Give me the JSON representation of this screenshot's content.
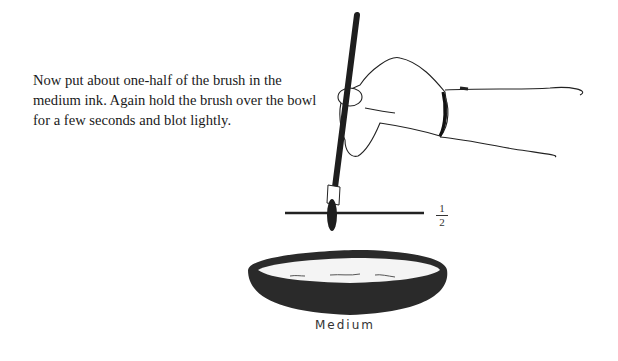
{
  "page": {
    "instruction_text": "Now put about one-half of the brush in the medium ink. Again hold the brush over the bowl for a few seconds and blot lightly.",
    "fraction": {
      "numerator": "1",
      "denominator": "2"
    },
    "bowl_label": "Medium"
  },
  "colors": {
    "ink": "#1e1e1e",
    "paper": "#ffffff",
    "line": "#222222"
  }
}
